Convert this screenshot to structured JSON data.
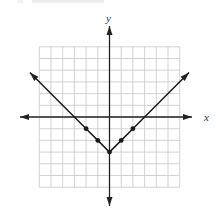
{
  "chart_data": {
    "type": "line",
    "title": "",
    "xlabel": "x",
    "ylabel": "y",
    "xlim": [
      -6,
      6
    ],
    "ylim": [
      -6,
      6
    ],
    "grid": true,
    "grid_step": 1,
    "function": "y = |x| - 3",
    "series": [
      {
        "name": "graph",
        "x": [
          -6.8,
          -2,
          -1,
          0,
          1,
          2,
          6.8
        ],
        "y": [
          3.8,
          -1,
          -2,
          -3,
          -2,
          -1,
          3.8
        ]
      }
    ],
    "marked_points": [
      {
        "x": -2,
        "y": -1
      },
      {
        "x": -1,
        "y": -2
      },
      {
        "x": 0,
        "y": -3
      },
      {
        "x": 1,
        "y": -2
      },
      {
        "x": 2,
        "y": -1
      }
    ],
    "legend": []
  },
  "labels": {
    "x_axis": "x",
    "y_axis": "y"
  },
  "colors": {
    "grid": "#c8c8c8",
    "axis": "#222222",
    "curve": "#1a1a1a"
  }
}
